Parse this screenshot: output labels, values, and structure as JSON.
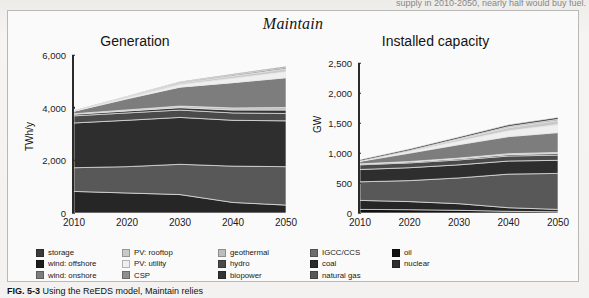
{
  "page": {
    "bleed_text_above": "supply in 2010-2050, nearly half would buy fuel.",
    "caption_label": "FIG. 5-3",
    "caption_body": "Using the ReEDS model, Maintain relies"
  },
  "figure": {
    "title": "Maintain"
  },
  "legend": {
    "columns": [
      {
        "items": [
          {
            "label": "storage",
            "color": "#3a3a3a"
          },
          {
            "label": "wind: offshore",
            "color": "#1d1d1d"
          },
          {
            "label": "wind: onshore",
            "color": "#7d7d7d"
          }
        ]
      },
      {
        "items": [
          {
            "label": "PV: rooftop",
            "color": "#c9c9c9"
          },
          {
            "label": "PV: utility",
            "color": "#efefef"
          },
          {
            "label": "CSP",
            "color": "#8f8f8f"
          }
        ]
      },
      {
        "items": [
          {
            "label": "geothermal",
            "color": "#bdbdbd"
          },
          {
            "label": "hydro",
            "color": "#4a4a4a"
          },
          {
            "label": "biopower",
            "color": "#343434"
          }
        ]
      },
      {
        "items": [
          {
            "label": "IGCC/CCS",
            "color": "#6e6e6e"
          },
          {
            "label": "coal",
            "color": "#2b2b2b"
          },
          {
            "label": "natural gas",
            "color": "#585858"
          }
        ]
      },
      {
        "items": [
          {
            "label": "oil",
            "color": "#111111"
          },
          {
            "label": "nuclear",
            "color": "#2e2e2e"
          }
        ]
      }
    ]
  },
  "chart_data": [
    {
      "type": "area",
      "stacked": true,
      "title": "Generation",
      "xlabel": "",
      "ylabel": "TWh/y",
      "x": [
        2010,
        2020,
        2030,
        2040,
        2050
      ],
      "xticks": [
        "2010",
        "2020",
        "2030",
        "2040",
        "2050"
      ],
      "yticks": [
        "0",
        "2,000",
        "4,000",
        "6,000"
      ],
      "ytick_values": [
        0,
        2000,
        4000,
        6000
      ],
      "ylim": [
        0,
        6000
      ],
      "xlim": [
        2010,
        2050
      ],
      "grid": false,
      "legend_position": "below",
      "series": [
        {
          "name": "coal",
          "color": "#262626",
          "values": [
            820,
            760,
            700,
            400,
            300
          ]
        },
        {
          "name": "natural gas",
          "color": "#585858",
          "values": [
            900,
            1000,
            1150,
            1380,
            1460
          ]
        },
        {
          "name": "nuclear",
          "color": "#2e2e2e",
          "values": [
            1700,
            1760,
            1780,
            1740,
            1740
          ]
        },
        {
          "name": "hydro",
          "color": "#4a4a4a",
          "values": [
            270,
            280,
            280,
            280,
            280
          ]
        },
        {
          "name": "biopower",
          "color": "#343434",
          "values": [
            60,
            75,
            90,
            110,
            130
          ]
        },
        {
          "name": "geothermal",
          "color": "#bdbdbd",
          "values": [
            20,
            40,
            60,
            80,
            95
          ]
        },
        {
          "name": "wind: onshore",
          "color": "#7d7d7d",
          "values": [
            95,
            420,
            720,
            960,
            1130
          ]
        },
        {
          "name": "PV: utility",
          "color": "#efefef",
          "values": [
            5,
            40,
            95,
            165,
            230
          ]
        },
        {
          "name": "PV: rooftop",
          "color": "#c9c9c9",
          "values": [
            5,
            25,
            55,
            85,
            105
          ]
        },
        {
          "name": "CSP",
          "color": "#8f8f8f",
          "values": [
            5,
            20,
            35,
            50,
            60
          ]
        },
        {
          "name": "storage",
          "color": "#3a3a3a",
          "values": [
            10,
            15,
            20,
            25,
            30
          ]
        }
      ]
    },
    {
      "type": "area",
      "stacked": true,
      "title": "Installed capacity",
      "xlabel": "",
      "ylabel": "GW",
      "x": [
        2010,
        2020,
        2030,
        2040,
        2050
      ],
      "xticks": [
        "2010",
        "2020",
        "2030",
        "2040",
        "2050"
      ],
      "yticks": [
        "0",
        "500",
        "1,000",
        "1,500",
        "2,000",
        "2,500"
      ],
      "ytick_values": [
        0,
        500,
        1000,
        1500,
        2000,
        2500
      ],
      "ylim": [
        0,
        2500
      ],
      "xlim": [
        2010,
        2050
      ],
      "grid": false,
      "legend_position": "below",
      "series": [
        {
          "name": "oil",
          "color": "#111111",
          "values": [
            60,
            55,
            45,
            28,
            20
          ]
        },
        {
          "name": "coal",
          "color": "#262626",
          "values": [
            150,
            135,
            110,
            60,
            40
          ]
        },
        {
          "name": "natural gas",
          "color": "#585858",
          "values": [
            310,
            350,
            430,
            560,
            600
          ]
        },
        {
          "name": "nuclear",
          "color": "#2e2e2e",
          "values": [
            205,
            215,
            218,
            218,
            218
          ]
        },
        {
          "name": "hydro",
          "color": "#4a4a4a",
          "values": [
            78,
            80,
            82,
            84,
            86
          ]
        },
        {
          "name": "biopower",
          "color": "#343434",
          "values": [
            12,
            15,
            18,
            22,
            26
          ]
        },
        {
          "name": "geothermal",
          "color": "#bdbdbd",
          "values": [
            4,
            8,
            12,
            16,
            20
          ]
        },
        {
          "name": "wind: onshore",
          "color": "#7d7d7d",
          "values": [
            42,
            140,
            225,
            285,
            330
          ]
        },
        {
          "name": "PV: utility",
          "color": "#efefef",
          "values": [
            3,
            25,
            58,
            98,
            135
          ]
        },
        {
          "name": "PV: rooftop",
          "color": "#c9c9c9",
          "values": [
            2,
            14,
            32,
            52,
            66
          ]
        },
        {
          "name": "CSP",
          "color": "#8f8f8f",
          "values": [
            1,
            6,
            12,
            18,
            22
          ]
        },
        {
          "name": "storage",
          "color": "#3a3a3a",
          "values": [
            22,
            24,
            26,
            28,
            30
          ]
        }
      ]
    }
  ]
}
